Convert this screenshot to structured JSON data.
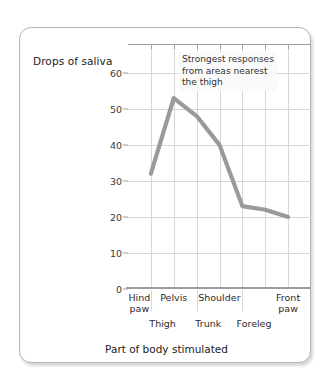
{
  "chart_data": {
    "type": "line",
    "title": "",
    "xlabel": "Part of body stimulated",
    "ylabel": "Drops of saliva",
    "categories": [
      "Hind paw",
      "Thigh",
      "Pelvis",
      "Trunk",
      "Shoulder",
      "Foreleg",
      "Front paw"
    ],
    "values": [
      32,
      53,
      48,
      40,
      23,
      22,
      20
    ],
    "series": [
      {
        "name": "Drops of saliva",
        "values": [
          32,
          53,
          48,
          40,
          23,
          22,
          20
        ],
        "color": "#9a9a9a"
      }
    ],
    "ylim": [
      0,
      68
    ],
    "yticks": [
      0,
      10,
      20,
      30,
      40,
      50,
      60
    ],
    "ytick_labels": [
      "0",
      "10",
      "20",
      "30",
      "40",
      "50",
      "60"
    ],
    "grid": true,
    "legend": "none",
    "annotations": [
      {
        "name": "strongest-responses-note",
        "lines": [
          "Strongest responses",
          "from areas nearest",
          "the thigh"
        ]
      }
    ],
    "line_color": "#9a9a9a",
    "grid_color": "#d7d7d7",
    "axis_color": "#9d9d9d"
  },
  "axes": {
    "y_title": "Drops of saliva",
    "x_title": "Part of body stimulated",
    "y_ticks": [
      "60",
      "50",
      "40",
      "30",
      "20",
      "10",
      "0"
    ],
    "x_labels_upper": [
      "Hind\npaw",
      "Pelvis",
      "Shoulder",
      "Front\npaw"
    ],
    "x_labels_upper_parts": [
      {
        "line1": "Hind",
        "line2": "paw"
      },
      {
        "line1": "Pelvis",
        "line2": ""
      },
      {
        "line1": "Shoulder",
        "line2": ""
      },
      {
        "line1": "Front",
        "line2": "paw"
      }
    ],
    "x_labels_lower": [
      "Thigh",
      "Trunk",
      "Foreleg"
    ]
  },
  "annotation": {
    "line1": "Strongest responses",
    "line2": "from areas nearest",
    "line3": "the thigh"
  }
}
